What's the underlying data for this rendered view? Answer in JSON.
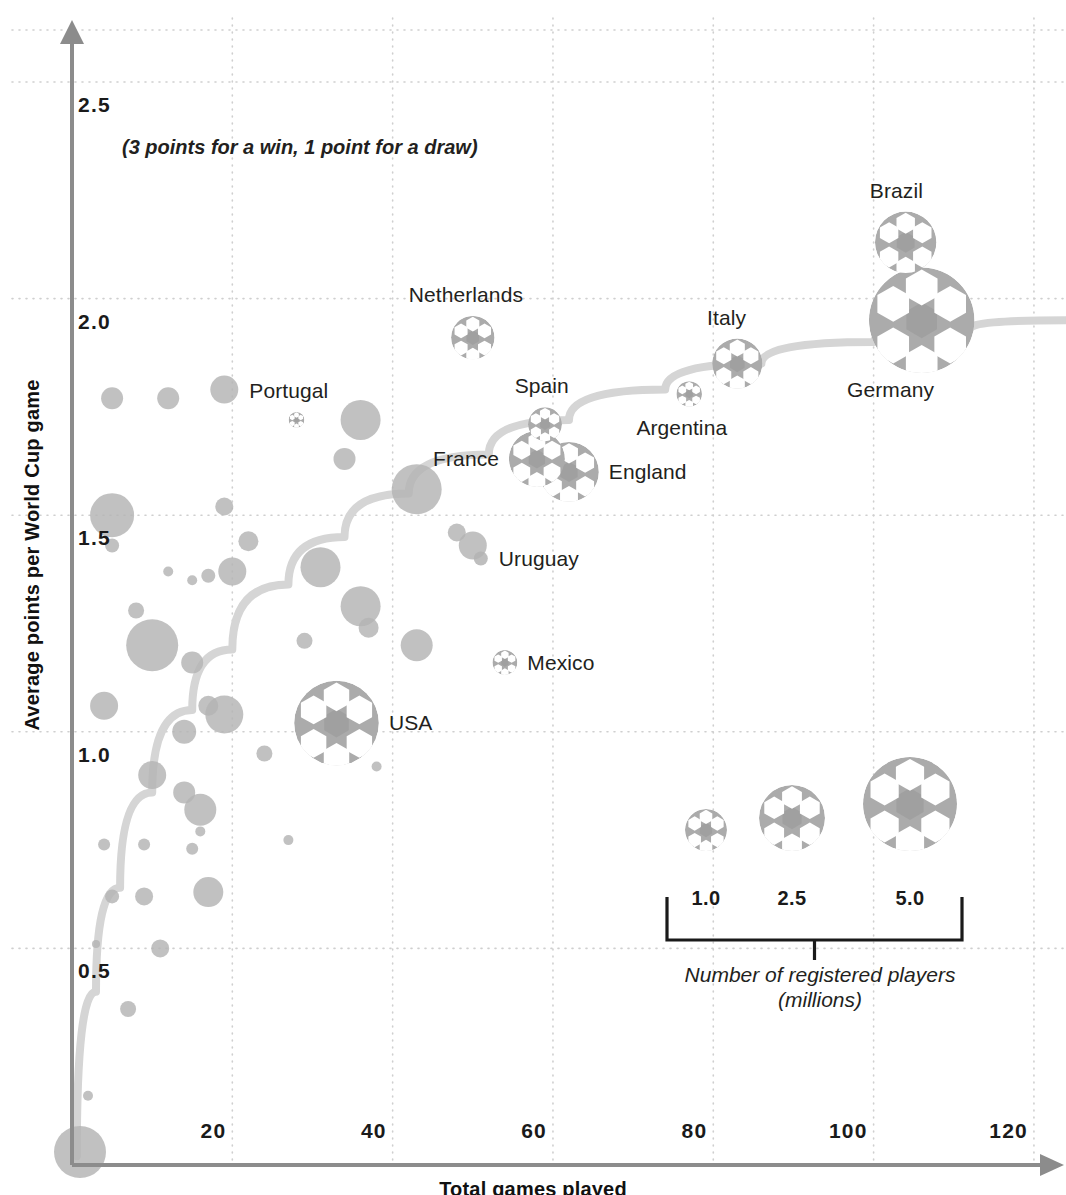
{
  "chart_data": {
    "type": "scatter",
    "title": "",
    "note": "(3 points for a win, 1 point for a draw)",
    "xlabel": "Total games played",
    "ylabel": "Average points per World Cup game",
    "xlim": [
      0,
      124
    ],
    "ylim": [
      0,
      2.62
    ],
    "xticks": [
      20,
      40,
      60,
      80,
      100,
      120
    ],
    "yticks": [
      0.5,
      1.0,
      1.5,
      2.0,
      2.5
    ],
    "grid": true,
    "legend_position": "bottom-right",
    "bubble_meaning": "Bubble area is proportional to the number of registered players (millions)",
    "series": [
      {
        "name": "Labelled nations",
        "marker": "soccer-ball",
        "points": [
          {
            "label": "Brazil",
            "x": 104,
            "y": 2.13,
            "players": 2.14,
            "label_pos": "above"
          },
          {
            "label": "Germany",
            "x": 106,
            "y": 1.95,
            "players": 6.31,
            "label_pos": "below-left"
          },
          {
            "label": "Italy",
            "x": 83,
            "y": 1.85,
            "players": 1.43,
            "label_pos": "above"
          },
          {
            "label": "Argentina",
            "x": 77,
            "y": 1.78,
            "players": 0.37,
            "label_pos": "below"
          },
          {
            "label": "Netherlands",
            "x": 50,
            "y": 1.91,
            "players": 1.07,
            "label_pos": "above"
          },
          {
            "label": "Spain",
            "x": 59,
            "y": 1.71,
            "players": 0.65,
            "label_pos": "above"
          },
          {
            "label": "France",
            "x": 58,
            "y": 1.63,
            "players": 1.78,
            "label_pos": "left"
          },
          {
            "label": "England",
            "x": 62,
            "y": 1.6,
            "players": 2.02,
            "label_pos": "right"
          },
          {
            "label": "Portugal",
            "x": 28,
            "y": 1.72,
            "players": 0.14,
            "label_pos": "above"
          },
          {
            "label": "Mexico",
            "x": 54,
            "y": 1.16,
            "players": 0.35,
            "label_pos": "right"
          },
          {
            "label": "USA",
            "x": 33,
            "y": 1.02,
            "players": 4.07,
            "label_pos": "right"
          },
          {
            "label": "Uruguay",
            "x": 51,
            "y": 1.4,
            "players": 0.08,
            "label_pos": "right"
          }
        ]
      },
      {
        "name": "Other nations",
        "marker": "plain-bubble",
        "points": [
          {
            "x": 5,
            "y": 1.77,
            "r": 11
          },
          {
            "x": 12,
            "y": 1.77,
            "r": 11
          },
          {
            "x": 19,
            "y": 1.79,
            "r": 14
          },
          {
            "x": 36,
            "y": 1.72,
            "r": 20
          },
          {
            "x": 34,
            "y": 1.63,
            "r": 11
          },
          {
            "x": 5,
            "y": 1.5,
            "r": 22
          },
          {
            "x": 19,
            "y": 1.52,
            "r": 9
          },
          {
            "x": 43,
            "y": 1.56,
            "r": 25
          },
          {
            "x": 5,
            "y": 1.43,
            "r": 7
          },
          {
            "x": 22,
            "y": 1.44,
            "r": 10
          },
          {
            "x": 48,
            "y": 1.46,
            "r": 9
          },
          {
            "x": 50,
            "y": 1.43,
            "r": 14
          },
          {
            "x": 12,
            "y": 1.37,
            "r": 5
          },
          {
            "x": 17,
            "y": 1.36,
            "r": 7
          },
          {
            "x": 20,
            "y": 1.37,
            "r": 14
          },
          {
            "x": 31,
            "y": 1.38,
            "r": 20
          },
          {
            "x": 15,
            "y": 1.35,
            "r": 5
          },
          {
            "x": 8,
            "y": 1.28,
            "r": 8
          },
          {
            "x": 36,
            "y": 1.29,
            "r": 20
          },
          {
            "x": 37,
            "y": 1.24,
            "r": 10
          },
          {
            "x": 10,
            "y": 1.2,
            "r": 26
          },
          {
            "x": 15,
            "y": 1.16,
            "r": 11
          },
          {
            "x": 29,
            "y": 1.21,
            "r": 8
          },
          {
            "x": 43,
            "y": 1.2,
            "r": 16
          },
          {
            "x": 4,
            "y": 1.06,
            "r": 14
          },
          {
            "x": 17,
            "y": 1.06,
            "r": 10
          },
          {
            "x": 19,
            "y": 1.04,
            "r": 19
          },
          {
            "x": 14,
            "y": 1.0,
            "r": 12
          },
          {
            "x": 24,
            "y": 0.95,
            "r": 8
          },
          {
            "x": 10,
            "y": 0.9,
            "r": 14
          },
          {
            "x": 14,
            "y": 0.86,
            "r": 11
          },
          {
            "x": 16,
            "y": 0.82,
            "r": 16
          },
          {
            "x": 34,
            "y": 0.96,
            "r": 9
          },
          {
            "x": 38,
            "y": 0.92,
            "r": 5
          },
          {
            "x": 4,
            "y": 0.74,
            "r": 6
          },
          {
            "x": 9,
            "y": 0.74,
            "r": 6
          },
          {
            "x": 16,
            "y": 0.77,
            "r": 5
          },
          {
            "x": 15,
            "y": 0.73,
            "r": 6
          },
          {
            "x": 27,
            "y": 0.75,
            "r": 5
          },
          {
            "x": 5,
            "y": 0.62,
            "r": 7
          },
          {
            "x": 9,
            "y": 0.62,
            "r": 9
          },
          {
            "x": 17,
            "y": 0.63,
            "r": 15
          },
          {
            "x": 3,
            "y": 0.51,
            "r": 4
          },
          {
            "x": 11,
            "y": 0.5,
            "r": 9
          },
          {
            "x": 7,
            "y": 0.36,
            "r": 8
          },
          {
            "x": 2,
            "y": 0.16,
            "r": 5
          },
          {
            "x": 1,
            "y": 0.03,
            "r": 26
          }
        ]
      }
    ],
    "trend_line": {
      "name": "fitted trend",
      "color": "#d5d5d5",
      "points": [
        {
          "x": 0.6,
          "y": 0.02
        },
        {
          "x": 3,
          "y": 0.4
        },
        {
          "x": 6,
          "y": 0.64
        },
        {
          "x": 10,
          "y": 0.86
        },
        {
          "x": 15,
          "y": 1.05
        },
        {
          "x": 20,
          "y": 1.19
        },
        {
          "x": 27,
          "y": 1.34
        },
        {
          "x": 34,
          "y": 1.45
        },
        {
          "x": 42,
          "y": 1.55
        },
        {
          "x": 52,
          "y": 1.64
        },
        {
          "x": 62,
          "y": 1.72
        },
        {
          "x": 74,
          "y": 1.79
        },
        {
          "x": 86,
          "y": 1.85
        },
        {
          "x": 100,
          "y": 1.9
        },
        {
          "x": 112,
          "y": 1.93
        },
        {
          "x": 124,
          "y": 1.95
        }
      ]
    }
  },
  "axes": {
    "y_title": "Average points per World Cup game",
    "x_title": "Total games played",
    "y_tick_labels": [
      "2.5",
      "2.0",
      "1.5",
      "1.0",
      "0.5"
    ],
    "x_tick_labels": [
      "20",
      "40",
      "60",
      "80",
      "100",
      "120"
    ]
  },
  "annotation": {
    "scoring_note": "(3 points for a win, 1 point for a draw)"
  },
  "legend": {
    "caption_line1": "Number of registered players",
    "caption_line2": "(millions)",
    "items": [
      {
        "value": "1.0",
        "radius": 21
      },
      {
        "value": "2.5",
        "radius": 33
      },
      {
        "value": "5.0",
        "radius": 47
      }
    ]
  },
  "country_labels": {
    "brazil": "Brazil",
    "germany": "Germany",
    "italy": "Italy",
    "argentina": "Argentina",
    "netherlands": "Netherlands",
    "spain": "Spain",
    "france": "France",
    "england": "England",
    "portugal": "Portugal",
    "mexico": "Mexico",
    "usa": "USA",
    "uruguay": "Uruguay"
  },
  "colors": {
    "bubble_fill": "#b3b3b3",
    "ball_panel": "#ababab",
    "ball_white": "#ffffff",
    "trend": "#d9d9d9",
    "grid": "#cfcfcf",
    "axis": "#8c8c8c",
    "text": "#231f20"
  }
}
